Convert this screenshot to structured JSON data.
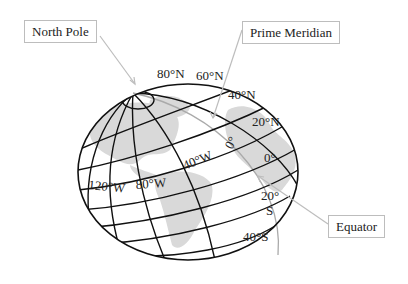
{
  "diagram": {
    "callouts": {
      "north_pole": "North Pole",
      "prime_meridian": "Prime Meridian",
      "equator": "Equator"
    },
    "latitude_labels": {
      "lat80n": "80°N",
      "lat60n": "60°N",
      "lat40n": "40°N",
      "lat20n": "20°N",
      "lat0": "0°",
      "lat20s_top": "20°",
      "lat20s_bottom": "S",
      "lat40s": "40°S"
    },
    "longitude_labels": {
      "lon120w": "120°W",
      "lon80w": "80°W",
      "lon40w": "40°W",
      "lon0": "0°"
    },
    "colors": {
      "grid_line": "#111111",
      "land": "#d9d9d9",
      "leader_line": "#bdbdbd",
      "callout_border": "#bdbdbd"
    }
  }
}
